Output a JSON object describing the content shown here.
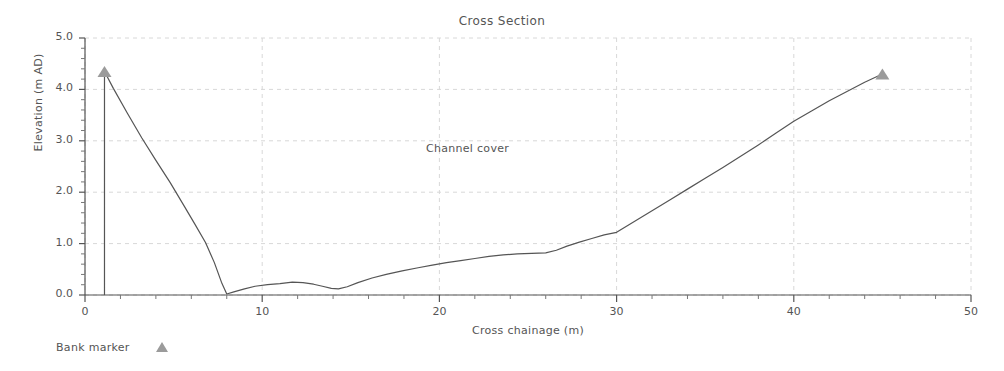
{
  "chart_data": {
    "type": "line",
    "title": "Cross Section",
    "xlabel": "Cross chainage (m)",
    "ylabel": "Elevation (m AD)",
    "xlim": [
      0,
      50
    ],
    "ylim": [
      0.0,
      5.0
    ],
    "xticks": [
      0,
      10,
      20,
      30,
      40,
      50
    ],
    "xtick_labels": [
      "0",
      "10",
      "20",
      "30",
      "40",
      "50"
    ],
    "yticks": [
      0.0,
      1.0,
      2.0,
      3.0,
      4.0,
      5.0
    ],
    "ytick_labels": [
      "0.0",
      "1.0",
      "2.0",
      "3.0",
      "4.0",
      "5.0"
    ],
    "grid": true,
    "grid_style": "dashed",
    "grid_color": "#d8d8d8",
    "minor_ticks": true,
    "line_color": "#555555",
    "marker_color": "#9b9b9b",
    "legend": [
      {
        "label": "Bank marker",
        "marker": "triangle",
        "color": "#9b9b9b"
      }
    ],
    "legend_position": "below-left",
    "annotations": [
      {
        "text": "Channel cover",
        "x": 21.5,
        "y": 2.83
      }
    ],
    "series": [
      {
        "name": "Cross section profile",
        "x": [
          1.1,
          1.1,
          1.6,
          2.4,
          3.2,
          4.0,
          4.8,
          5.6,
          6.2,
          6.8,
          7.3,
          7.7,
          8.0,
          8.4,
          9.0,
          9.6,
          10.3,
          11.0,
          11.7,
          12.3,
          12.9,
          13.4,
          13.9,
          14.3,
          14.8,
          15.4,
          16.2,
          17.0,
          17.9,
          18.8,
          19.6,
          20.4,
          21.2,
          22.0,
          22.8,
          23.6,
          24.4,
          25.2,
          26.0,
          26.6,
          27.2,
          27.9,
          28.6,
          29.3,
          30.0,
          31.0,
          32.0,
          33.0,
          34.0,
          35.0,
          36.0,
          37.0,
          38.0,
          39.0,
          40.0,
          41.0,
          42.0,
          43.0,
          44.0,
          45.0
        ],
        "y": [
          0.0,
          4.35,
          4.02,
          3.53,
          3.06,
          2.62,
          2.19,
          1.73,
          1.38,
          1.02,
          0.63,
          0.25,
          0.02,
          0.06,
          0.12,
          0.17,
          0.2,
          0.22,
          0.25,
          0.24,
          0.21,
          0.17,
          0.13,
          0.12,
          0.16,
          0.24,
          0.33,
          0.4,
          0.47,
          0.53,
          0.58,
          0.63,
          0.67,
          0.71,
          0.75,
          0.78,
          0.8,
          0.81,
          0.82,
          0.87,
          0.95,
          1.03,
          1.1,
          1.17,
          1.22,
          1.43,
          1.64,
          1.85,
          2.06,
          2.27,
          2.48,
          2.7,
          2.92,
          3.15,
          3.38,
          3.58,
          3.78,
          3.96,
          4.14,
          4.3
        ]
      }
    ],
    "bank_markers": [
      {
        "x": 1.1,
        "y": 4.35
      },
      {
        "x": 45.0,
        "y": 4.3
      }
    ]
  }
}
